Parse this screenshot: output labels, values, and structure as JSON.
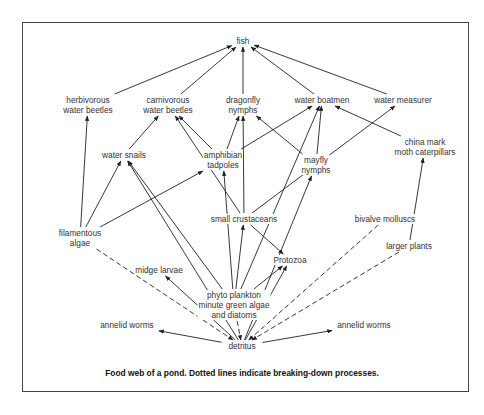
{
  "diagram": {
    "caption": "Food web of a pond. Dotted lines indicate breaking-down processes.",
    "colors": {
      "line": "#222222",
      "text": "#333333",
      "frame": "#444444",
      "background": "#ffffff"
    },
    "nodes": {
      "fish": {
        "label": "fish",
        "x": 243,
        "y": 41
      },
      "herbivorous_water_beetles": {
        "label": "herbivorous\nwater beetles",
        "x": 88,
        "y": 105
      },
      "carnivorous_water_beetles": {
        "label": "carnivorous\nwater beetles",
        "x": 168,
        "y": 105
      },
      "dragonfly_nymphs": {
        "label": "dragonfly\nnymphs",
        "x": 243,
        "y": 105
      },
      "water_boatmen": {
        "label": "water boatmen",
        "x": 322,
        "y": 100
      },
      "water_measurer": {
        "label": "water measurer",
        "x": 403,
        "y": 100
      },
      "china_mark_moth_caterpillars": {
        "label": "china mark\nmoth caterpillars",
        "x": 425,
        "y": 147
      },
      "water_snails": {
        "label": "water snails",
        "x": 124,
        "y": 155
      },
      "amphibian_tadpoles": {
        "label": "amphibian\ntadpoles",
        "x": 223,
        "y": 160
      },
      "mayfly_nymphs": {
        "label": "mayfly\nnymphs",
        "x": 316,
        "y": 165
      },
      "small_crustaceans": {
        "label": "small crustaceans",
        "x": 244,
        "y": 219
      },
      "bivalve_molluscs": {
        "label": "bivalve molluscs",
        "x": 385,
        "y": 219
      },
      "filamentous_algae": {
        "label": "filamentous\nalgae",
        "x": 80,
        "y": 238
      },
      "larger_plants": {
        "label": "larger plants",
        "x": 409,
        "y": 246
      },
      "protozoa": {
        "label": "Protozoa",
        "x": 290,
        "y": 260
      },
      "midge_larvae": {
        "label": "midge larvae",
        "x": 159,
        "y": 270
      },
      "phyto_plankton": {
        "label": "phyto plankton\nminute green algae\nand diatoms",
        "x": 234,
        "y": 305
      },
      "annelid_worms_left": {
        "label": "annelid worms",
        "x": 127,
        "y": 325
      },
      "annelid_worms_right": {
        "label": "annelid worms",
        "x": 364,
        "y": 325
      },
      "detritus": {
        "label": "detritus",
        "x": 242,
        "y": 346
      }
    },
    "edges": [
      {
        "from": "herbivorous_water_beetles",
        "to": "fish",
        "style": "solid"
      },
      {
        "from": "carnivorous_water_beetles",
        "to": "fish",
        "style": "solid"
      },
      {
        "from": "dragonfly_nymphs",
        "to": "fish",
        "style": "solid"
      },
      {
        "from": "water_boatmen",
        "to": "fish",
        "style": "solid"
      },
      {
        "from": "water_measurer",
        "to": "fish",
        "style": "solid"
      },
      {
        "from": "filamentous_algae",
        "to": "herbivorous_water_beetles",
        "style": "solid"
      },
      {
        "from": "water_snails",
        "to": "carnivorous_water_beetles",
        "style": "solid"
      },
      {
        "from": "amphibian_tadpoles",
        "to": "carnivorous_water_beetles",
        "style": "solid"
      },
      {
        "from": "small_crustaceans",
        "to": "carnivorous_water_beetles",
        "style": "solid"
      },
      {
        "from": "amphibian_tadpoles",
        "to": "dragonfly_nymphs",
        "style": "solid"
      },
      {
        "from": "small_crustaceans",
        "to": "dragonfly_nymphs",
        "style": "solid"
      },
      {
        "from": "mayfly_nymphs",
        "to": "dragonfly_nymphs",
        "style": "solid"
      },
      {
        "from": "amphibian_tadpoles",
        "to": "water_boatmen",
        "style": "solid"
      },
      {
        "from": "phyto_plankton",
        "to": "water_boatmen",
        "style": "solid"
      },
      {
        "from": "mayfly_nymphs",
        "to": "water_boatmen",
        "style": "solid"
      },
      {
        "from": "china_mark_moth_caterpillars",
        "to": "water_boatmen",
        "style": "solid"
      },
      {
        "from": "small_crustaceans",
        "to": "water_measurer",
        "style": "solid"
      },
      {
        "from": "larger_plants",
        "to": "china_mark_moth_caterpillars",
        "style": "solid"
      },
      {
        "from": "filamentous_algae",
        "to": "water_snails",
        "style": "solid"
      },
      {
        "from": "phyto_plankton",
        "to": "water_snails",
        "style": "solid"
      },
      {
        "from": "detritus",
        "to": "water_snails",
        "style": "solid"
      },
      {
        "from": "filamentous_algae",
        "to": "amphibian_tadpoles",
        "style": "solid"
      },
      {
        "from": "phyto_plankton",
        "to": "amphibian_tadpoles",
        "style": "solid"
      },
      {
        "from": "detritus",
        "to": "mayfly_nymphs",
        "style": "solid"
      },
      {
        "from": "phyto_plankton",
        "to": "small_crustaceans",
        "style": "solid"
      },
      {
        "from": "small_crustaceans",
        "to": "protozoa",
        "style": "solid"
      },
      {
        "from": "phyto_plankton",
        "to": "protozoa",
        "style": "solid"
      },
      {
        "from": "detritus",
        "to": "protozoa",
        "style": "solid"
      },
      {
        "from": "detritus",
        "to": "midge_larvae",
        "style": "solid"
      },
      {
        "from": "detritus",
        "to": "annelid_worms_left",
        "style": "solid"
      },
      {
        "from": "detritus",
        "to": "annelid_worms_right",
        "style": "solid"
      },
      {
        "from": "filamentous_algae",
        "to": "detritus",
        "style": "dashed"
      },
      {
        "from": "phyto_plankton",
        "to": "detritus",
        "style": "dashed"
      },
      {
        "from": "bivalve_molluscs",
        "to": "detritus",
        "style": "dashed"
      },
      {
        "from": "larger_plants",
        "to": "detritus",
        "style": "dashed"
      }
    ]
  }
}
